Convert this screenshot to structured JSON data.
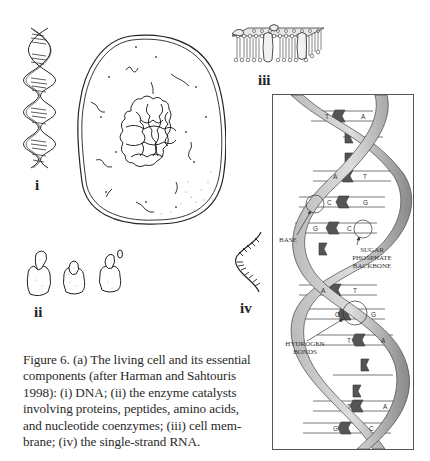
{
  "figure": {
    "caption": "Figure 6. (a) The living cell and its essential components (after Harman and Sahtouris 1998): (i) DNA; (ii) the enzyme catalysts involving proteins, peptides, amino acids, and nucleotide coenzymes; (iii) cell membrane; (iv) the single-strand RNA.",
    "caption_lines": [
      "Figure 6. (a) The living cell and its essential",
      "components (after Harman and Sahtouris",
      "1998): (i) DNA; (ii) the enzyme catalysts",
      "involving proteins, peptides, amino acids,",
      "and nucleotide coenzymes; (iii) cell mem-",
      "brane; (iv) the single-strand RNA."
    ],
    "labels": {
      "i": "i",
      "ii": "ii",
      "iii": "iii",
      "iv": "iv"
    },
    "components": [
      {
        "id": "i",
        "name": "DNA double helix"
      },
      {
        "id": "ii",
        "name": "enzyme catalysts"
      },
      {
        "id": "iii",
        "name": "cell membrane"
      },
      {
        "id": "iv",
        "name": "single-strand RNA"
      }
    ],
    "detail_panel": {
      "annotations": {
        "base": "BASE",
        "sugar_phosphate_1": "SUGAR",
        "sugar_phosphate_2": "PHOSPHATE",
        "sugar_phosphate_3": "BACKBONE",
        "hydrogen_1": "HYDROGEN",
        "hydrogen_2": "BONDS"
      },
      "base_pairs": [
        [
          "T",
          "A"
        ],
        [
          "",
          ""
        ],
        [
          "",
          ""
        ],
        [
          "A",
          "T"
        ],
        [
          "C",
          "G"
        ],
        [
          "G",
          "C"
        ],
        [
          "",
          ""
        ],
        [
          "A",
          "T"
        ],
        [
          "C",
          "G"
        ],
        [
          "T",
          "A"
        ],
        [
          "",
          ""
        ],
        [
          "T",
          "A"
        ],
        [
          "G",
          "C"
        ]
      ]
    }
  }
}
